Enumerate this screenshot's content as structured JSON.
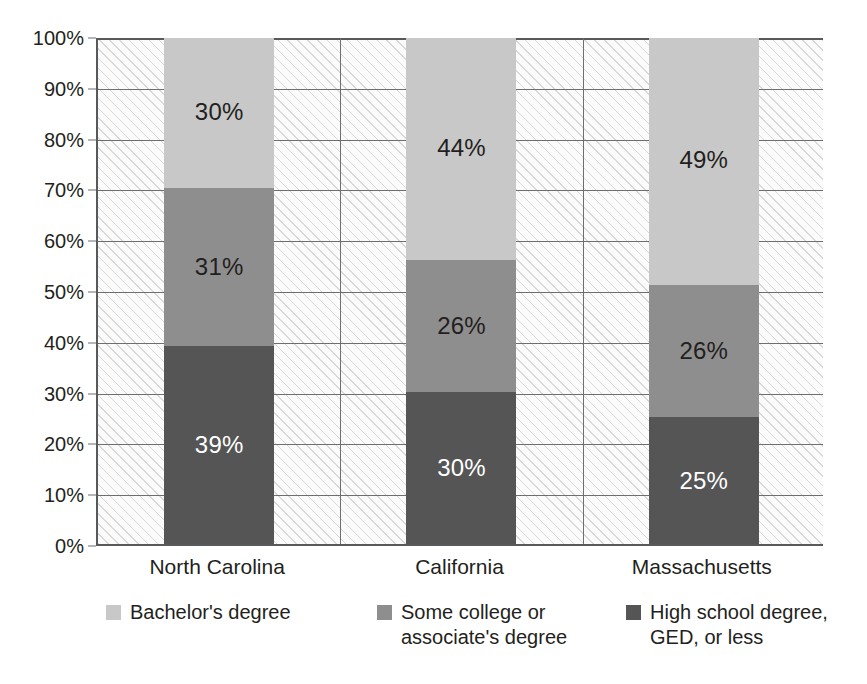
{
  "chart_data": {
    "type": "bar",
    "subtype": "stacked-percent",
    "title": "",
    "xlabel": "",
    "ylabel": "",
    "ylim": [
      0,
      100
    ],
    "grid": true,
    "legend_position": "bottom",
    "categories": [
      "North Carolina",
      "California",
      "Massachusetts"
    ],
    "series": [
      {
        "name": "High school degree, GED, or less",
        "color": "#555555",
        "values": [
          39,
          30,
          25
        ],
        "labels": [
          "39%",
          "30%",
          "25%"
        ]
      },
      {
        "name": "Some college or associate's degree",
        "color": "#8e8e8e",
        "values": [
          31,
          26,
          26
        ],
        "labels": [
          "31%",
          "26%",
          "26%"
        ]
      },
      {
        "name": "Bachelor's degree",
        "color": "#c8c8c8",
        "values": [
          30,
          44,
          49
        ],
        "labels": [
          "30%",
          "44%",
          "49%"
        ]
      }
    ],
    "yticks": [
      0,
      10,
      20,
      30,
      40,
      50,
      60,
      70,
      80,
      90,
      100
    ],
    "ytick_labels": [
      "0%",
      "10%",
      "20%",
      "30%",
      "40%",
      "50%",
      "60%",
      "70%",
      "80%",
      "90%",
      "100%"
    ]
  },
  "axis": {
    "y_ticks": [
      {
        "value": 100,
        "label": "100%"
      },
      {
        "value": 90,
        "label": "90%"
      },
      {
        "value": 80,
        "label": "80%"
      },
      {
        "value": 70,
        "label": "70%"
      },
      {
        "value": 60,
        "label": "60%"
      },
      {
        "value": 50,
        "label": "50%"
      },
      {
        "value": 40,
        "label": "40%"
      },
      {
        "value": 30,
        "label": "30%"
      },
      {
        "value": 20,
        "label": "20%"
      },
      {
        "value": 10,
        "label": "10%"
      },
      {
        "value": 0,
        "label": "0%"
      }
    ],
    "x_categories": [
      {
        "label": "North Carolina"
      },
      {
        "label": "California"
      },
      {
        "label": "Massachusetts"
      }
    ]
  },
  "bars": [
    {
      "category": "North Carolina",
      "segments": [
        {
          "key": "bachelors",
          "label": "30%",
          "value": 30,
          "bottom": 70,
          "color": "#c8c8c8",
          "label_color": "dark"
        },
        {
          "key": "somecoll",
          "label": "31%",
          "value": 31,
          "bottom": 39,
          "color": "#8e8e8e",
          "label_color": "dark"
        },
        {
          "key": "highschool",
          "label": "39%",
          "value": 39,
          "bottom": 0,
          "color": "#555555",
          "label_color": "light"
        }
      ]
    },
    {
      "category": "California",
      "segments": [
        {
          "key": "bachelors",
          "label": "44%",
          "value": 44,
          "bottom": 56,
          "color": "#c8c8c8",
          "label_color": "dark"
        },
        {
          "key": "somecoll",
          "label": "26%",
          "value": 26,
          "bottom": 30,
          "color": "#8e8e8e",
          "label_color": "dark"
        },
        {
          "key": "highschool",
          "label": "30%",
          "value": 30,
          "bottom": 0,
          "color": "#555555",
          "label_color": "light"
        }
      ]
    },
    {
      "category": "Massachusetts",
      "segments": [
        {
          "key": "bachelors",
          "label": "49%",
          "value": 49,
          "bottom": 51,
          "color": "#c8c8c8",
          "label_color": "dark"
        },
        {
          "key": "somecoll",
          "label": "26%",
          "value": 26,
          "bottom": 25,
          "color": "#8e8e8e",
          "label_color": "dark"
        },
        {
          "key": "highschool",
          "label": "25%",
          "value": 25,
          "bottom": 0,
          "color": "#555555",
          "label_color": "light"
        }
      ]
    }
  ],
  "legend": {
    "items": [
      {
        "key": "bachelors",
        "label": "Bachelor's degree",
        "color": "#c8c8c8",
        "left": 10,
        "indent": 0
      },
      {
        "key": "somecoll",
        "label": "Some college or\nassociate's degree",
        "color": "#8e8e8e",
        "left": 281,
        "indent": 0
      },
      {
        "key": "highschool",
        "label": "High school degree,\nGED, or less",
        "color": "#555555",
        "left": 530,
        "indent": 0
      }
    ]
  },
  "colors": {
    "bachelors": "#c8c8c8",
    "some_college": "#8e8e8e",
    "high_school": "#555555",
    "axis": "#58595b",
    "gridline": "#6d6e71",
    "text": "#231f20",
    "plot_background": "#fbfbfb"
  }
}
